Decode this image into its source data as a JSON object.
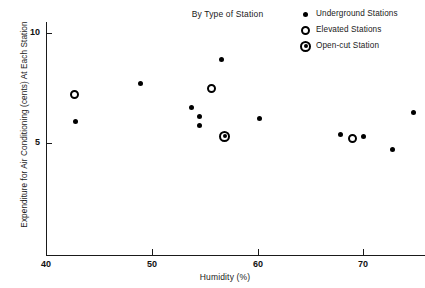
{
  "chart_data": {
    "type": "scatter",
    "title": "By Type of Station",
    "xlabel": "Humidity (%)",
    "ylabel": "Expenditure for Air Conditioning (cents) At Each Station",
    "xlim": [
      40,
      75
    ],
    "ylim": [
      2.5,
      10.6
    ],
    "xticks": [
      40,
      50,
      60,
      70
    ],
    "xtick_labels": [
      "40",
      "50",
      "60",
      "70"
    ],
    "yticks": [
      5,
      10
    ],
    "ytick_labels": [
      "5",
      "10"
    ],
    "grid": false,
    "legend_position": "top-right",
    "series": [
      {
        "name": "Underground Stations",
        "marker": "filled-circle",
        "color": "#000000",
        "points": [
          {
            "x": 42.8,
            "y": 6.0
          },
          {
            "x": 48.9,
            "y": 7.7
          },
          {
            "x": 53.8,
            "y": 6.6
          },
          {
            "x": 54.5,
            "y": 6.2
          },
          {
            "x": 54.5,
            "y": 5.8
          },
          {
            "x": 56.6,
            "y": 8.8
          },
          {
            "x": 60.2,
            "y": 6.1
          },
          {
            "x": 67.9,
            "y": 5.4
          },
          {
            "x": 70.0,
            "y": 5.3
          },
          {
            "x": 72.8,
            "y": 4.7
          },
          {
            "x": 74.8,
            "y": 6.4
          }
        ]
      },
      {
        "name": "Elevated Stations",
        "marker": "open-circle",
        "color": "#000000",
        "points": [
          {
            "x": 42.7,
            "y": 7.2
          },
          {
            "x": 55.7,
            "y": 7.5
          },
          {
            "x": 69.0,
            "y": 5.2
          }
        ]
      },
      {
        "name": "Open-cut Station",
        "marker": "ringed-circle",
        "color": "#000000",
        "points": [
          {
            "x": 56.9,
            "y": 5.3
          }
        ]
      }
    ]
  },
  "legend": {
    "items": [
      {
        "label": "Underground Stations",
        "marker": "filled-circle"
      },
      {
        "label": "Elevated Stations",
        "marker": "open-circle"
      },
      {
        "label": "Open-cut Station",
        "marker": "ringed-circle"
      }
    ]
  },
  "axes": {
    "x_tick_labels": [
      "40",
      "50",
      "60",
      "70"
    ],
    "y_tick_labels": [
      "10",
      "5"
    ]
  }
}
